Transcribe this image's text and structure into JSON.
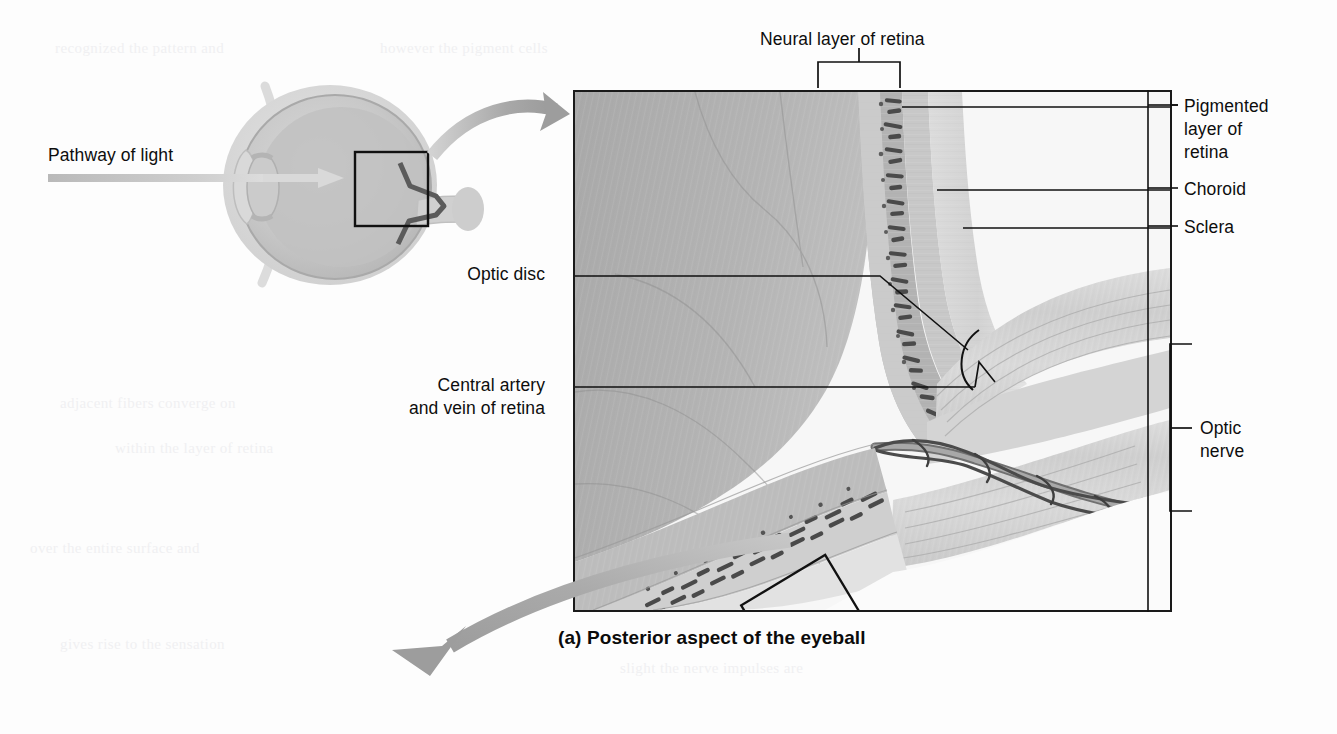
{
  "figure": {
    "caption": "(a) Posterior aspect of the eyeball",
    "type": "anatomical-illustration"
  },
  "overview": {
    "pathway_label": "Pathway of light",
    "inset_box_note": "magnified region at optic disc"
  },
  "labels": {
    "neural_layer": "Neural layer of retina",
    "pigmented_layer": "Pigmented\nlayer of\nretina",
    "choroid": "Choroid",
    "sclera": "Sclera",
    "optic_disc": "Optic disc",
    "central_vessels": "Central artery\nand vein of retina",
    "optic_nerve": "Optic\nnerve"
  },
  "colors": {
    "ink": "#111111",
    "panel_border": "#1a1a1a",
    "arrow_gray": "#a6a6a6",
    "page": "#fdfdfd",
    "tissue_light": "#e7e7e7",
    "tissue_mid": "#c4c4c4",
    "tissue_dark": "#8f8f8f"
  },
  "bleed_text": {
    "l1": "recognized   the   pattern   and",
    "l2": "however   the   pigment   cells",
    "l3": "adjacent   fibers   converge   on",
    "l4": "within   the   layer   of   retina",
    "l5": "over   the   entire   surface   and",
    "l6": "gives   rise   to   the   sensation",
    "l7": "slight   the   nerve   impulses   are",
    "l8": "optic   nerve   fibers   exit   here"
  }
}
